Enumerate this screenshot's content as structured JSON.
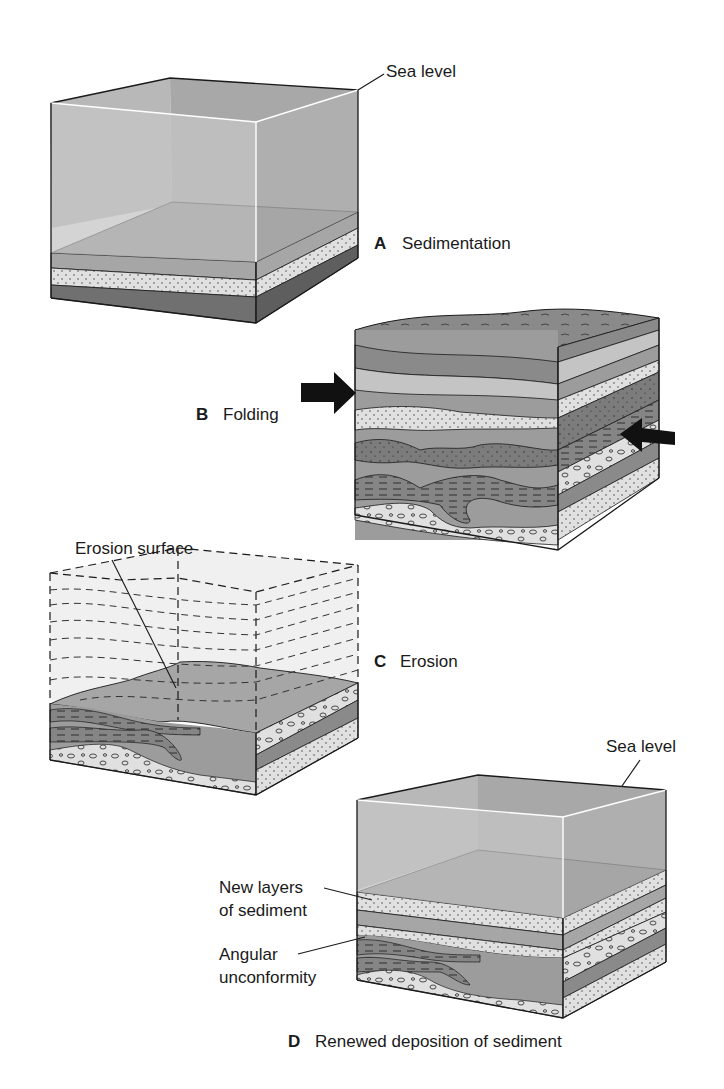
{
  "figure": {
    "type": "geology-diagram",
    "panels": [
      {
        "letter": "A",
        "caption": "Sedimentation",
        "callouts": [
          "Sea level"
        ]
      },
      {
        "letter": "B",
        "caption": "Folding",
        "callouts": []
      },
      {
        "letter": "C",
        "caption": "Erosion",
        "callouts": [
          "Erosion surface"
        ]
      },
      {
        "letter": "D",
        "caption": "Renewed deposition of sediment",
        "callouts": [
          "Sea level",
          "New layers",
          "of sediment",
          "Angular",
          "unconformity"
        ]
      }
    ]
  },
  "colors": {
    "water": "#bdbdbd",
    "water_back": "#a9a9a9",
    "sediment_dark": "#7c7c7c",
    "sediment_mid": "#9c9c9c",
    "sediment_light": "#c4c4c4",
    "sand": "#e0e0e0",
    "outline": "#1a1a1a",
    "ghost": "#ececec"
  }
}
